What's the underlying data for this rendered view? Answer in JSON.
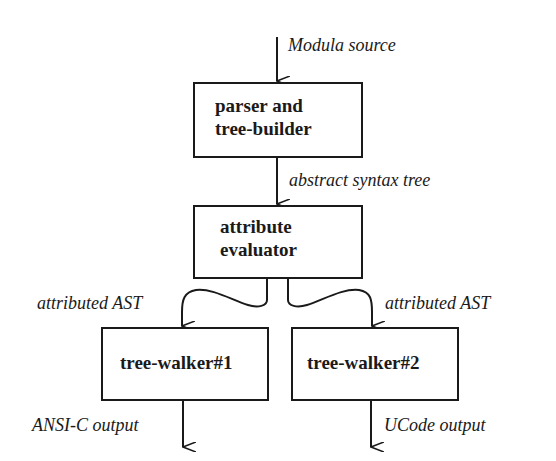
{
  "diagram": {
    "nodes": {
      "parser": {
        "line1": "parser and",
        "line2": "tree-builder"
      },
      "evaluator": {
        "line1": "attribute",
        "line2": "evaluator"
      },
      "walker1": {
        "label": "tree-walker#1"
      },
      "walker2": {
        "label": "tree-walker#2"
      }
    },
    "edges": {
      "input": {
        "label": "Modula source"
      },
      "parser_to_evaluator": {
        "label": "abstract syntax tree"
      },
      "evaluator_to_walker1": {
        "label": "attributed AST"
      },
      "evaluator_to_walker2": {
        "label": "attributed AST"
      },
      "walker1_output": {
        "label": "ANSI-C output"
      },
      "walker2_output": {
        "label": "UCode output"
      }
    },
    "colors": {
      "ink": "#1a1a1a",
      "background": "#ffffff"
    }
  }
}
